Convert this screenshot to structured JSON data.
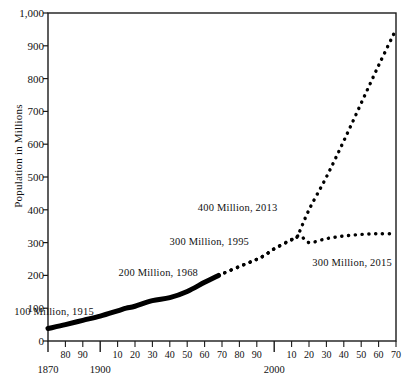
{
  "chart_data": {
    "type": "line",
    "title": "",
    "xlabel": "",
    "ylabel": "Population in Millions",
    "xlim": [
      1870,
      2070
    ],
    "ylim": [
      0,
      1000
    ],
    "grid": false,
    "legend": "none",
    "y_ticks": [
      "0",
      "100",
      "200",
      "300",
      "400",
      "500",
      "600",
      "700",
      "800",
      "900",
      "1,000"
    ],
    "y_tick_values": [
      0,
      100,
      200,
      300,
      400,
      500,
      600,
      700,
      800,
      900,
      1000
    ],
    "x_tick_values": [
      1870,
      1880,
      1890,
      1900,
      1910,
      1920,
      1930,
      1940,
      1950,
      1960,
      1970,
      1980,
      1990,
      2000,
      2010,
      2020,
      2030,
      2040,
      2050,
      2060,
      2070
    ],
    "x_tick_labels": [
      "1870",
      "80",
      "90",
      "1900",
      "10",
      "20",
      "30",
      "40",
      "50",
      "60",
      "70",
      "80",
      "90",
      "2000",
      "10",
      "20",
      "30",
      "40",
      "50",
      "60",
      "70"
    ],
    "x_major_labels": [
      "1870",
      "1900",
      "2000"
    ],
    "x_major_values": [
      1870,
      1900,
      2000
    ],
    "series": [
      {
        "name": "Historical population",
        "style": "solid",
        "color": "#000000",
        "x": [
          1870,
          1880,
          1890,
          1900,
          1910,
          1915,
          1920,
          1930,
          1940,
          1950,
          1960,
          1968
        ],
        "values": [
          38,
          50,
          63,
          76,
          92,
          100,
          106,
          123,
          132,
          151,
          179,
          200
        ]
      },
      {
        "name": "High projection",
        "style": "dotted",
        "color": "#000000",
        "x": [
          1968,
          1980,
          1990,
          1995,
          2000,
          2010,
          2013,
          2020,
          2030,
          2040,
          2050,
          2060,
          2070
        ],
        "values": [
          200,
          227,
          249,
          263,
          281,
          309,
          316,
          400,
          500,
          610,
          725,
          840,
          950
        ]
      },
      {
        "name": "Low projection",
        "style": "dotted",
        "color": "#000000",
        "x": [
          1968,
          1980,
          1990,
          1995,
          2000,
          2010,
          2015,
          2020,
          2030,
          2040,
          2050,
          2060,
          2070
        ],
        "values": [
          200,
          227,
          249,
          263,
          281,
          309,
          321,
          300,
          312,
          320,
          325,
          327,
          327
        ]
      }
    ],
    "annotations": [
      {
        "text": "100 Million, 1915",
        "x": 1915,
        "y": 100
      },
      {
        "text": "200 Million, 1968",
        "x": 1968,
        "y": 200
      },
      {
        "text": "300 Million, 1995",
        "x": 1995,
        "y": 300
      },
      {
        "text": "400 Million, 2013",
        "x": 2013,
        "y": 400
      },
      {
        "text": "300 Million, 2015",
        "x": 2015,
        "y": 300
      }
    ]
  }
}
